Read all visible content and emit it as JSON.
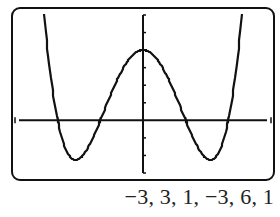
{
  "caption": "−3, 3, 1, −3, 6, 1",
  "colors": {
    "curve": "#111111",
    "axes": "#111111",
    "frame": "#111111",
    "background": "#ffffff"
  },
  "chart_data": {
    "type": "line",
    "title": "",
    "xlabel": "",
    "ylabel": "",
    "window": {
      "xmin": -3,
      "xmax": 3,
      "xscl": 1,
      "ymin": -3,
      "ymax": 6,
      "yscl": 1
    },
    "xlim": [
      -3,
      3
    ],
    "ylim": [
      -3,
      6
    ],
    "grid": false,
    "legend": null,
    "series": [
      {
        "name": "y = x^4 - 5x^2 + 4",
        "x": [
          -2.4,
          -2.3,
          -2.2,
          -2.1,
          -2.0,
          -1.9,
          -1.8,
          -1.7,
          -1.6,
          -1.5,
          -1.4,
          -1.3,
          -1.2,
          -1.1,
          -1.0,
          -0.9,
          -0.8,
          -0.7,
          -0.6,
          -0.5,
          -0.4,
          -0.3,
          -0.2,
          -0.1,
          0.0,
          0.1,
          0.2,
          0.3,
          0.4,
          0.5,
          0.6,
          0.7,
          0.8,
          0.9,
          1.0,
          1.1,
          1.2,
          1.3,
          1.4,
          1.5,
          1.6,
          1.7,
          1.8,
          1.9,
          2.0,
          2.1,
          2.2,
          2.3,
          2.4
        ],
        "values": [
          6.38,
          3.53,
          1.22,
          -0.6,
          0.0,
          -1.0,
          -1.7,
          -2.1,
          -2.24,
          -2.19,
          -1.96,
          -1.59,
          -1.13,
          -0.59,
          0.0,
          0.61,
          1.21,
          1.79,
          2.33,
          2.81,
          3.23,
          3.56,
          3.8,
          3.95,
          4.0,
          3.95,
          3.8,
          3.56,
          3.23,
          2.81,
          2.33,
          1.79,
          1.21,
          0.61,
          0.0,
          -0.59,
          -1.13,
          -1.59,
          -1.96,
          -2.19,
          -2.24,
          -2.1,
          -1.7,
          -1.0,
          0.0,
          1.22,
          1.22,
          3.53,
          6.38
        ]
      }
    ],
    "features": {
      "zeros": [
        -2,
        -1,
        1,
        2
      ],
      "local_max": {
        "x": 0,
        "y": 4
      },
      "local_min": [
        {
          "x": -1.58,
          "y": -2.25
        },
        {
          "x": 1.58,
          "y": -2.25
        }
      ]
    }
  }
}
